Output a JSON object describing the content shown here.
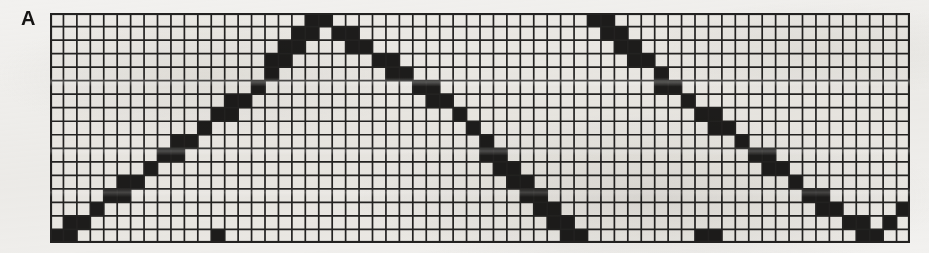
{
  "panel": {
    "label": "A",
    "type": "dot-matrix-grid-plot",
    "background_color": "#f2f1ef"
  },
  "grid": {
    "columns": 64,
    "rows": 17,
    "cell_width": 13.4,
    "cell_height": 13.5,
    "left": 50,
    "top": 13,
    "width": 860,
    "height": 230,
    "line_color": "#232221",
    "cell_fill_color": "#eceae6",
    "filled_cell_color": "#1d1c1b",
    "grid_line_width": 1.7,
    "border_line_width": 2.2,
    "grid_visible": true
  },
  "chart_data": {
    "type": "heatmap",
    "title": "",
    "subtitle": "",
    "xlabel": "",
    "ylabel": "",
    "xlim": [
      0,
      64
    ],
    "ylim": [
      0,
      17
    ],
    "grid": true,
    "legend": "none",
    "annotations": [
      "A"
    ],
    "filled_cells": [
      [
        0,
        16
      ],
      [
        1,
        16
      ],
      [
        1,
        15
      ],
      [
        2,
        15
      ],
      [
        3,
        14
      ],
      [
        4,
        13
      ],
      [
        5,
        13
      ],
      [
        5,
        12
      ],
      [
        6,
        12
      ],
      [
        7,
        11
      ],
      [
        8,
        10
      ],
      [
        9,
        10
      ],
      [
        9,
        9
      ],
      [
        10,
        9
      ],
      [
        11,
        8
      ],
      [
        12,
        7
      ],
      [
        13,
        7
      ],
      [
        13,
        6
      ],
      [
        14,
        6
      ],
      [
        15,
        5
      ],
      [
        16,
        4
      ],
      [
        16,
        3
      ],
      [
        17,
        3
      ],
      [
        17,
        2
      ],
      [
        18,
        2
      ],
      [
        18,
        1
      ],
      [
        19,
        1
      ],
      [
        19,
        0
      ],
      [
        20,
        0
      ],
      [
        21,
        1
      ],
      [
        22,
        1
      ],
      [
        22,
        2
      ],
      [
        23,
        2
      ],
      [
        24,
        3
      ],
      [
        25,
        3
      ],
      [
        25,
        4
      ],
      [
        26,
        4
      ],
      [
        27,
        5
      ],
      [
        28,
        5
      ],
      [
        28,
        6
      ],
      [
        29,
        6
      ],
      [
        30,
        7
      ],
      [
        31,
        8
      ],
      [
        32,
        9
      ],
      [
        32,
        10
      ],
      [
        33,
        10
      ],
      [
        33,
        11
      ],
      [
        34,
        11
      ],
      [
        34,
        12
      ],
      [
        35,
        12
      ],
      [
        35,
        13
      ],
      [
        36,
        13
      ],
      [
        36,
        14
      ],
      [
        37,
        14
      ],
      [
        37,
        15
      ],
      [
        38,
        15
      ],
      [
        38,
        16
      ],
      [
        39,
        16
      ],
      [
        40,
        0
      ],
      [
        41,
        0
      ],
      [
        41,
        1
      ],
      [
        42,
        1
      ],
      [
        42,
        2
      ],
      [
        43,
        2
      ],
      [
        43,
        3
      ],
      [
        44,
        3
      ],
      [
        45,
        4
      ],
      [
        45,
        5
      ],
      [
        46,
        5
      ],
      [
        47,
        6
      ],
      [
        48,
        7
      ],
      [
        49,
        7
      ],
      [
        49,
        8
      ],
      [
        50,
        8
      ],
      [
        51,
        9
      ],
      [
        52,
        10
      ],
      [
        53,
        10
      ],
      [
        53,
        11
      ],
      [
        54,
        11
      ],
      [
        55,
        12
      ],
      [
        56,
        13
      ],
      [
        57,
        13
      ],
      [
        57,
        14
      ],
      [
        58,
        14
      ],
      [
        59,
        15
      ],
      [
        60,
        15
      ],
      [
        60,
        16
      ],
      [
        61,
        16
      ],
      [
        49,
        16
      ],
      [
        48,
        16
      ],
      [
        62,
        15
      ],
      [
        63,
        14
      ],
      [
        12,
        16
      ]
    ],
    "waveform_segments": [
      {
        "name": "rise-1",
        "from_col": 0,
        "to_col": 20,
        "from_row": 16,
        "to_row": 0
      },
      {
        "name": "fall-1",
        "from_col": 20,
        "to_col": 39,
        "from_row": 0,
        "to_row": 16
      },
      {
        "name": "reset-1",
        "from_col": 39,
        "to_col": 40,
        "from_row": 16,
        "to_row": 0
      },
      {
        "name": "fall-2",
        "from_col": 40,
        "to_col": 52,
        "from_row": 0,
        "to_row": 16
      },
      {
        "name": "rise-2",
        "from_col": 52,
        "to_col": 63,
        "from_row": 16,
        "to_row": 0
      }
    ]
  }
}
